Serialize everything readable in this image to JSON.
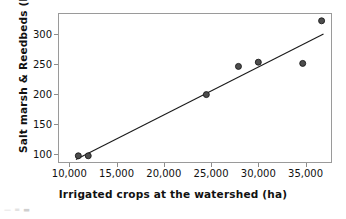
{
  "chart_data": {
    "type": "scatter",
    "title": "",
    "xlabel": "Irrigated crops at the watershed (ha)",
    "ylabel": "Salt marsh & Reedbeds (ha)",
    "xlim": [
      8800,
      37800
    ],
    "ylim": [
      85,
      335
    ],
    "grid": false,
    "legend": "none",
    "xticks": [
      10000,
      15000,
      20000,
      25000,
      30000,
      35000
    ],
    "xtick_labels": [
      "10,000",
      "15,000",
      "20,000",
      "25,000",
      "30,000",
      "35,000"
    ],
    "yticks": [
      100,
      150,
      200,
      250,
      300
    ],
    "ytick_labels": [
      "100",
      "150",
      "200",
      "250",
      "300"
    ],
    "marker_color": "#4d4d4d",
    "marker_edge_color": "#1a1a1a",
    "line_color": "#1a1a1a",
    "frame_color": "#9a9a9a",
    "points": [
      {
        "x": 10950,
        "y": 97
      },
      {
        "x": 12000,
        "y": 97
      },
      {
        "x": 24500,
        "y": 199
      },
      {
        "x": 27900,
        "y": 246
      },
      {
        "x": 30000,
        "y": 253
      },
      {
        "x": 34700,
        "y": 251
      },
      {
        "x": 36700,
        "y": 322
      }
    ],
    "trendline": {
      "x_start": 10700,
      "y_start": 91,
      "x_end": 36900,
      "y_end": 300
    }
  },
  "artifact": {
    "text": "— = ▬"
  }
}
